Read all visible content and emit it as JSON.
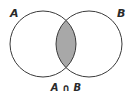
{
  "diagram": {
    "type": "venn",
    "sets": [
      {
        "name": "A",
        "label": "A"
      },
      {
        "name": "B",
        "label": "B"
      }
    ],
    "intersection": {
      "label_parts": [
        "A",
        "∩",
        "B"
      ],
      "label": "A ∩ B",
      "shaded": true
    },
    "colors": {
      "stroke": "#3a3a3a",
      "shade": "#a8a8a8",
      "background": "#ffffff"
    }
  }
}
